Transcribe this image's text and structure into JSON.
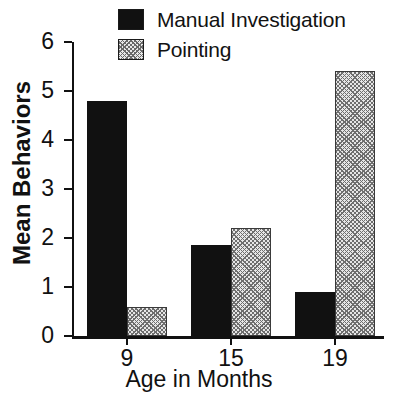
{
  "chart_data": {
    "type": "bar",
    "title": "",
    "xlabel": "Age in Months",
    "ylabel": "Mean Behaviors",
    "categories": [
      "9",
      "15",
      "19"
    ],
    "series": [
      {
        "name": "Manual Investigation",
        "values": [
          4.8,
          1.85,
          0.9
        ],
        "fill": "solid-black",
        "color": "#111111"
      },
      {
        "name": "Pointing",
        "values": [
          0.6,
          2.2,
          5.4
        ],
        "fill": "gray-crosshatch",
        "color": "#e6e6e6"
      }
    ],
    "ylim": [
      0,
      6
    ],
    "yticks": [
      0,
      1,
      2,
      3,
      4,
      5,
      6
    ],
    "ytick_labels": [
      "0",
      "1",
      "2",
      "3",
      "4",
      "5",
      "6"
    ],
    "xtick_labels": [
      "9",
      "15",
      "19"
    ],
    "grid": false,
    "legend_position": "top-center"
  },
  "legend": {
    "items": [
      {
        "label": "Manual Investigation",
        "swatch": "solid-black-swatch"
      },
      {
        "label": "Pointing",
        "swatch": "gray-crosshatch-swatch"
      }
    ]
  },
  "axes": {
    "y_title": "Mean Behaviors",
    "x_title": "Age in Months"
  }
}
